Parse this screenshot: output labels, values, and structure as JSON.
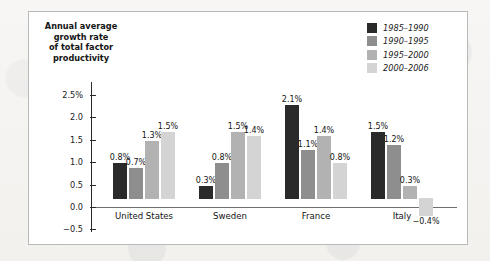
{
  "chart_data": {
    "type": "bar",
    "title_lines": [
      "Annual average",
      "growth rate",
      "of total factor",
      "productivity"
    ],
    "xlabel": "",
    "ylabel": "",
    "categories": [
      "United States",
      "Sweden",
      "France",
      "Italy"
    ],
    "series": [
      {
        "name": "1985–1990",
        "color": "#2a2a2a",
        "values": [
          0.8,
          0.3,
          2.1,
          1.5
        ],
        "labels": [
          "0.8%",
          "0.3%",
          "2.1%",
          "1.5%"
        ]
      },
      {
        "name": "1990–1995",
        "color": "#8e8e8e",
        "values": [
          0.7,
          0.8,
          1.1,
          1.2
        ],
        "labels": [
          "0.7%",
          "0.8%",
          "1.1%",
          "1.2%"
        ]
      },
      {
        "name": "1995–2000",
        "color": "#b2b2b2",
        "values": [
          1.3,
          1.5,
          1.4,
          0.3
        ],
        "labels": [
          "1.3%",
          "1.5%",
          "1.4%",
          "0.3%"
        ]
      },
      {
        "name": "2000–2006",
        "color": "#d4d4d4",
        "values": [
          1.5,
          1.4,
          0.8,
          -0.4
        ],
        "labels": [
          "1.5%",
          "1.4%",
          "0.8%",
          "−0.4%"
        ]
      }
    ],
    "yticks": [
      {
        "value": 2.5,
        "label": "2.5%"
      },
      {
        "value": 2.0,
        "label": "2.0"
      },
      {
        "value": 1.5,
        "label": "1.5"
      },
      {
        "value": 1.0,
        "label": "1.0"
      },
      {
        "value": 0.5,
        "label": "0.5"
      },
      {
        "value": 0.0,
        "label": "0.0"
      },
      {
        "value": -0.5,
        "label": "−0.5"
      }
    ],
    "ylim": [
      -0.5,
      2.5
    ],
    "grid": false,
    "legend_position": "top-right",
    "axis_color": "#2a2a2a",
    "zero_line_color": "#6f6f6f"
  }
}
